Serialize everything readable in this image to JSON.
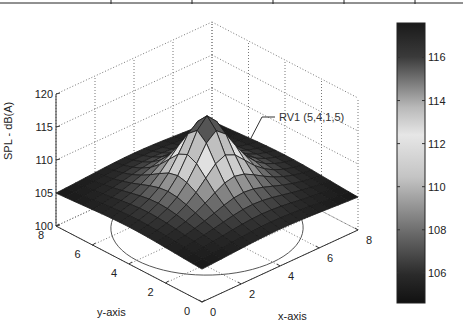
{
  "chart_data": {
    "type": "surface3d",
    "title": "",
    "xlabel": "x-axis",
    "ylabel": "y-axis",
    "zlabel": "SPL - dB(A)",
    "x_ticks": [
      "0",
      "2",
      "4",
      "6",
      "8"
    ],
    "y_ticks": [
      "0",
      "2",
      "4",
      "6",
      "8"
    ],
    "z_ticks": [
      "100",
      "105",
      "110",
      "115",
      "120"
    ],
    "xlim": [
      0,
      8
    ],
    "ylim": [
      0,
      8
    ],
    "zlim": [
      100,
      120
    ],
    "grid": true,
    "colormap": "custom-gray (dark low, light mid, dark high)",
    "colorbar": {
      "ticks": [
        "106",
        "108",
        "110",
        "112",
        "114",
        "116"
      ],
      "range": [
        104.6,
        117.6
      ]
    },
    "annotation": {
      "text": "RV1 (5,4,1,5)",
      "points_to": "surface peak region"
    },
    "surface": {
      "description": "Sound pressure level peaking near the source at the center of the grid and decaying toward the corners",
      "peak": {
        "x": 4,
        "y": 4,
        "z": 117
      },
      "corner_values": {
        "x0_y0": 104.3,
        "x0_y8": 104.7,
        "x8_y0": 104.5,
        "x8_y8": 104.5
      },
      "grid_resolution": 17
    },
    "base_circle": {
      "center_x": 4,
      "center_y": 4,
      "radius": 3.5,
      "z": 100
    }
  },
  "labels": {
    "zlabel": "SPL - dB(A)",
    "xlabel": "x-axis",
    "ylabel": "y-axis",
    "annotation": "RV1 (5,4,1,5)"
  }
}
